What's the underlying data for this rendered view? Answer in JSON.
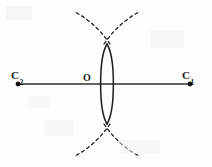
{
  "figure": {
    "kind": "geometric-construction-diagram",
    "width": 212,
    "height": 167,
    "background_color": "#fdfdfc",
    "ink_color": "#1b1b1b",
    "line_color": "#2a2a2a"
  },
  "labels": {
    "left_center": {
      "main": "C",
      "sub": "2",
      "x": 11,
      "y": 66
    },
    "right_center": {
      "main": "C",
      "sub": "1",
      "x": 182,
      "y": 66
    },
    "origin": {
      "main": "O",
      "sub": "",
      "x": 83,
      "y": 68
    }
  },
  "axis": {
    "name": "line-of-centers",
    "y": 84,
    "x_start": 18,
    "x_end": 190,
    "stroke_width": 1.6,
    "color": "#2f2f2f",
    "endpoint_marker": "filled-dot",
    "endpoint_radius": 2.4
  },
  "points": [
    {
      "name": "C2",
      "x": 18,
      "y": 84
    },
    {
      "name": "O",
      "x": 107,
      "y": 84
    },
    {
      "name": "C1",
      "x": 190,
      "y": 84
    }
  ],
  "lens": {
    "name": "vesica-piscis",
    "center_x": 107,
    "center_y": 84,
    "top_tip_y": 44,
    "bottom_tip_y": 124,
    "max_half_width": 8.5,
    "stroke_width": 1.5,
    "color": "#1b1b1b",
    "left_arc": "M 107 44 C 98.5 58 98.5 110 107 124",
    "right_arc": "M 107 44 C 115.5 58 115.5 110 107 124"
  },
  "dashed_arcs": {
    "name": "construction-arcs",
    "stroke_width": 1.3,
    "color": "#1b1b1b",
    "dash_pattern": "3 3.2",
    "crossing_top": {
      "x": 107,
      "y": 42
    },
    "crossing_bottom": {
      "x": 107,
      "y": 126
    },
    "segments": [
      {
        "name": "upper-left-arc",
        "path": "M 110 44 C 101 31 90 20 75 12"
      },
      {
        "name": "upper-right-arc",
        "path": "M 104 44 C 113 31 124 20 139 12"
      },
      {
        "name": "lower-left-arc",
        "path": "M 110 124 C 101 137 90 148 75 156"
      },
      {
        "name": "lower-right-arc",
        "path": "M 104 124 C 113 137 124 148 139 156"
      }
    ]
  },
  "chart_data": {
    "type": "scatter",
    "title": "",
    "xlabel": "",
    "ylabel": "",
    "annotations": [
      "C2",
      "O",
      "C1"
    ],
    "x": [
      18,
      107,
      190
    ],
    "y": [
      84,
      84,
      84
    ],
    "grid": false,
    "legend": "none"
  }
}
